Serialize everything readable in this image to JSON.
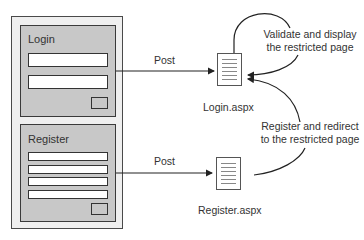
{
  "diagram": {
    "forms": {
      "login": {
        "title": "Login",
        "fields": 2,
        "has_button": true
      },
      "register": {
        "title": "Register",
        "fields": 4,
        "has_button": true
      }
    },
    "edges": [
      {
        "from": "login-form",
        "to": "login-page",
        "label": "Post"
      },
      {
        "from": "register-form",
        "to": "register-page",
        "label": "Post"
      },
      {
        "from": "login-page",
        "to": "login-page",
        "label": "Validate and display the restricted page"
      },
      {
        "from": "register-page",
        "to": "login-page",
        "label": "Register and redirect to the restricted page"
      }
    ],
    "pages": {
      "login": {
        "label": "Login.aspx",
        "icon": "document-icon"
      },
      "register": {
        "label": "Register.aspx",
        "icon": "document-icon"
      }
    },
    "annotations": {
      "post_login": "Post",
      "post_register": "Post",
      "validate_line1": "Validate and display",
      "validate_line2": "the restricted page",
      "register_line1": "Register and redirect",
      "register_line2": "to the restricted page"
    }
  }
}
